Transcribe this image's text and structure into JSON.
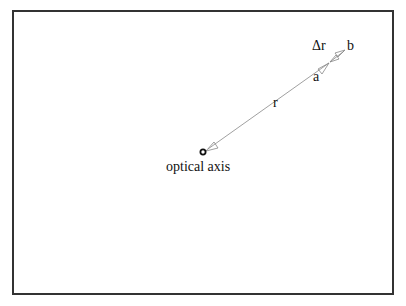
{
  "diagram": {
    "labels": {
      "r": "r",
      "delta_r": "Δr",
      "a": "a",
      "b": "b",
      "optical_axis": "optical axis"
    },
    "colors": {
      "border": "#333333",
      "line": "#777777",
      "text": "#111111"
    }
  }
}
